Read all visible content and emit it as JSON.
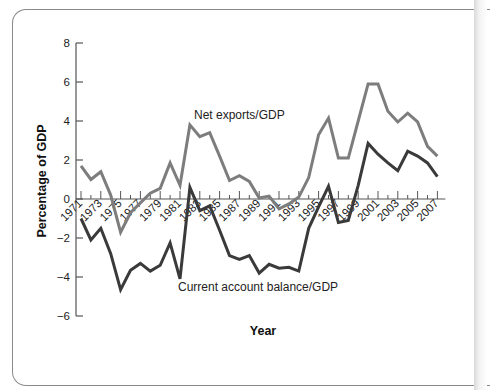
{
  "chart_data": {
    "type": "line",
    "title": "",
    "xlabel": "Year",
    "ylabel": "Percentage of GDP",
    "ylim": [
      -6,
      8
    ],
    "yticks": [
      8,
      6,
      4,
      2,
      0,
      -2,
      -4,
      -6
    ],
    "xtick_labels": [
      "1971",
      "1973",
      "1975",
      "1977",
      "1979",
      "1981",
      "1983",
      "1985",
      "1987",
      "1989",
      "1991",
      "1993",
      "1995",
      "1997",
      "1999",
      "2001",
      "2003",
      "2005",
      "2007"
    ],
    "grid": false,
    "legend": "inline labels",
    "x": [
      1971,
      1972,
      1973,
      1974,
      1975,
      1976,
      1977,
      1978,
      1979,
      1980,
      1981,
      1982,
      1983,
      1984,
      1985,
      1986,
      1987,
      1988,
      1989,
      1990,
      1991,
      1992,
      1993,
      1994,
      1995,
      1996,
      1997,
      1998,
      1999,
      2000,
      2001,
      2002,
      2003,
      2004,
      2005,
      2006,
      2007
    ],
    "series": [
      {
        "name": "Net exports/GDP",
        "color": "#7d7d7d",
        "values": [
          1.7,
          1.0,
          1.4,
          0.2,
          -1.7,
          -0.7,
          -0.2,
          0.3,
          0.55,
          1.85,
          0.7,
          3.8,
          3.2,
          3.4,
          2.2,
          0.95,
          1.2,
          0.9,
          0.05,
          0.15,
          -0.5,
          -0.25,
          0.1,
          1.1,
          3.3,
          4.15,
          2.1,
          2.1,
          4.0,
          5.9,
          5.9,
          4.5,
          3.95,
          4.4,
          3.95,
          2.7,
          2.2
        ]
      },
      {
        "name": "Current account balance/GDP",
        "color": "#3a3a3a",
        "values": [
          -1.0,
          -2.1,
          -1.5,
          -2.8,
          -4.65,
          -3.65,
          -3.3,
          -3.7,
          -3.4,
          -2.25,
          -4.1,
          0.6,
          -0.6,
          -0.35,
          -1.6,
          -2.9,
          -3.1,
          -2.9,
          -3.8,
          -3.35,
          -3.55,
          -3.5,
          -3.7,
          -1.5,
          -0.4,
          0.65,
          -1.2,
          -1.1,
          0.7,
          2.85,
          2.3,
          1.85,
          1.45,
          2.45,
          2.2,
          1.85,
          1.15
        ]
      }
    ]
  },
  "labels": {
    "ylabel": "Percentage of GDP",
    "xlabel": "Year",
    "series_net_exports": "Net exports/GDP",
    "series_current_account": "Current account balance/GDP"
  }
}
